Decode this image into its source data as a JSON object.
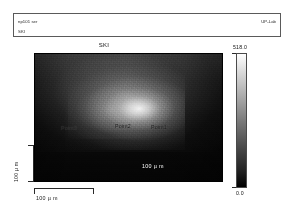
{
  "header": {
    "sample_id": "np101 ser",
    "lab": "UP-Lab",
    "dataset": "SKI"
  },
  "plot": {
    "title": "SKI",
    "annotations": [
      {
        "label": "Point1"
      },
      {
        "label": "Point2"
      },
      {
        "label": "Point3"
      }
    ],
    "inner_scalebar": "100  µ m"
  },
  "axes": {
    "y_label": "100 µ m",
    "x_label": "100  µ m"
  },
  "colorbar": {
    "max": "518.0",
    "min": "0.0"
  },
  "chart_data": {
    "type": "heatmap",
    "title": "SKI",
    "xlabel": "100 µ m",
    "ylabel": "100 µ m",
    "colormap": "grayscale",
    "zlim": [
      0.0,
      518.0
    ],
    "grid": false,
    "legend": "colorbar-right",
    "annotations": [
      {
        "label": "Point1",
        "x_frac": 0.65,
        "y_frac": 0.56
      },
      {
        "label": "Point2",
        "x_frac": 0.46,
        "y_frac": 0.55
      },
      {
        "label": "Point3",
        "x_frac": 0.17,
        "y_frac": 0.57
      }
    ]
  }
}
